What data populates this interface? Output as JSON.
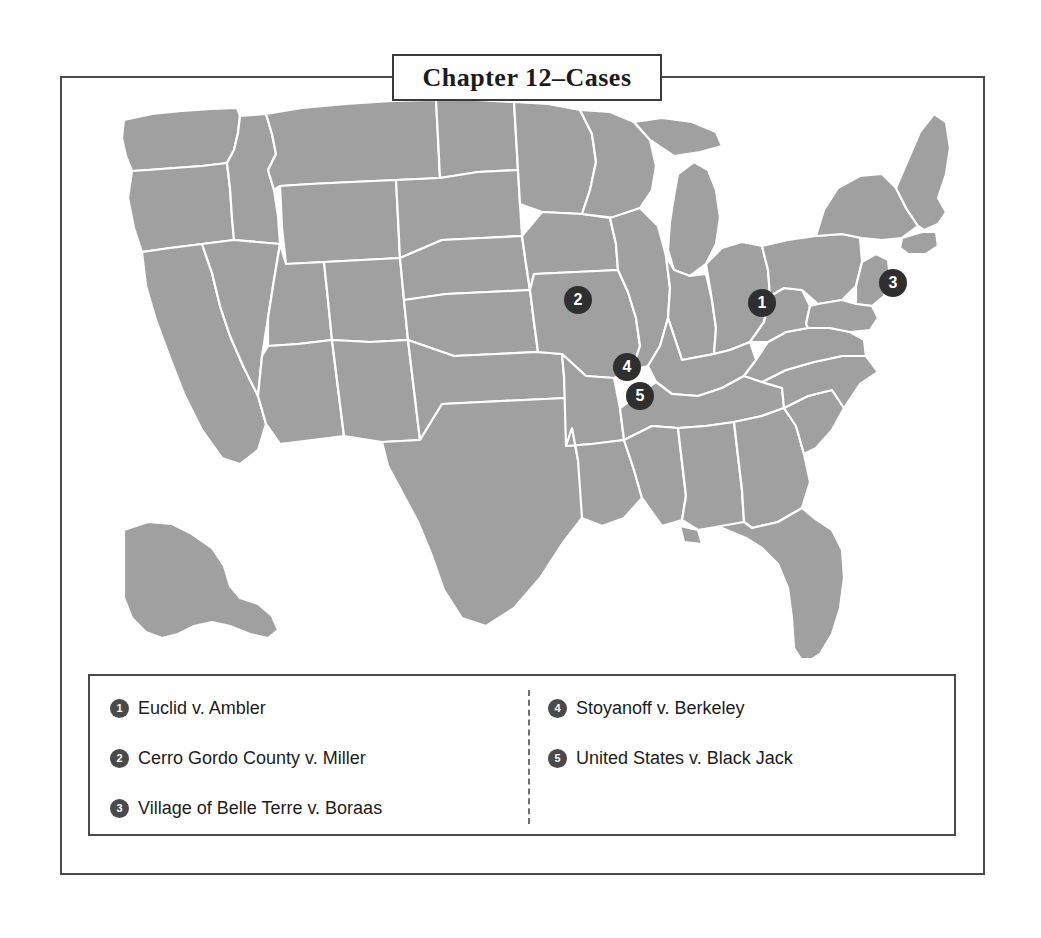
{
  "figure": {
    "title": "Chapter 12–Cases",
    "map_fill_color": "#a0a0a0",
    "map_border_color": "#ffffff",
    "marker_color": "#2f2f2f",
    "frame_color": "#4a4a4a",
    "background_color": "#ffffff"
  },
  "map": {
    "name": "united-states-map",
    "markers": [
      {
        "id": "1",
        "label": "1",
        "x": 762,
        "y": 303,
        "case": "Euclid v. Ambler"
      },
      {
        "id": "2",
        "label": "2",
        "x": 578,
        "y": 300,
        "case": "Cerro Gordo County v. Miller"
      },
      {
        "id": "3",
        "label": "3",
        "x": 893,
        "y": 283,
        "case": "Village of Belle Terre v. Boraas"
      },
      {
        "id": "4",
        "label": "4",
        "x": 627,
        "y": 367,
        "case": "Stoyanoff v. Berkeley"
      },
      {
        "id": "5",
        "label": "5",
        "x": 640,
        "y": 396,
        "case": "United States v. Black Jack"
      }
    ]
  },
  "legend": {
    "columns": [
      {
        "items": [
          {
            "number": "1",
            "label": "Euclid v. Ambler"
          },
          {
            "number": "2",
            "label": "Cerro Gordo County v. Miller"
          },
          {
            "number": "3",
            "label": "Village of Belle Terre v. Boraas"
          }
        ]
      },
      {
        "items": [
          {
            "number": "4",
            "label": "Stoyanoff v. Berkeley"
          },
          {
            "number": "5",
            "label": "United States v. Black Jack"
          }
        ]
      }
    ]
  }
}
